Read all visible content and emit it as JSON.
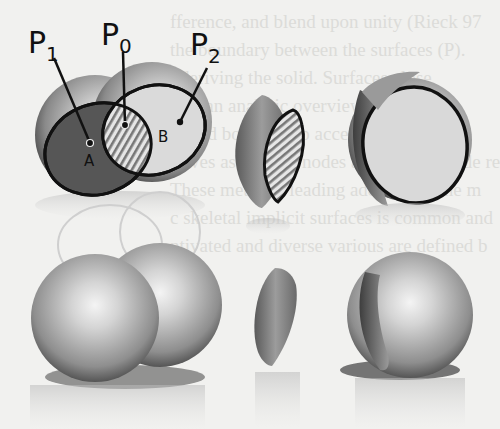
{
  "figure": {
    "labels": {
      "p1": "P",
      "p1_sub": "1",
      "p0": "P",
      "p0_sub": "0",
      "p2": "P",
      "p2_sub": "2",
      "region_a": "A",
      "region_b": "B"
    }
  },
  "background_text_lines": [
    "fference, and blend upon unity (Rieck 97",
    "the boundary between the surfaces (P).",
    "t deriving the solid. Surfaces close",
    "ows an analytic overview of [Ca97].",
    "ly and both top-up accessible and in",
    "ntives as the leaf nodes and interior node re",
    "These methods leading address for the m",
    "c skeletal implicit surfaces is common and",
    "ntivated and diverse various are defined b"
  ],
  "colors": {
    "background": "#f1f1ef",
    "sphere_light": "#e8e8e8",
    "sphere_dark": "#5a5a5a",
    "region_a_fill": "#555555",
    "region_b_fill": "#d9d9d9",
    "outline": "#111111"
  }
}
